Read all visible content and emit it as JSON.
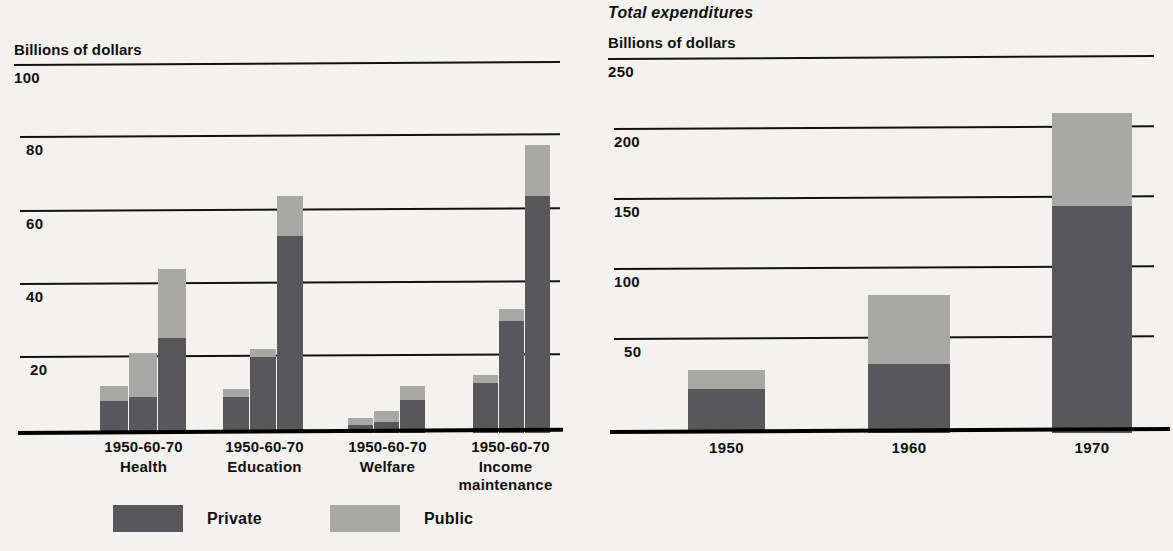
{
  "legend": {
    "items": [
      {
        "label": "Private",
        "color": "#58585a",
        "key": "private"
      },
      {
        "label": "Public",
        "color": "#a8a8a6",
        "key": "public"
      }
    ]
  },
  "left_panel": {
    "axis_title": "Billions of dollars",
    "yticks": [
      "100",
      "80",
      "60",
      "40",
      "20"
    ],
    "group_period_label": "1950-60-70",
    "groups": [
      "Health",
      "Education",
      "Welfare",
      "Income maintenance"
    ]
  },
  "right_panel": {
    "title": "Total expenditures",
    "axis_title": "Billions of dollars",
    "yticks": [
      "250",
      "200",
      "150",
      "100",
      "50"
    ],
    "xticks": [
      "1950",
      "1960",
      "1970"
    ]
  },
  "chart_data": [
    {
      "type": "bar",
      "id": "social-welfare-by-category",
      "title": "",
      "subtitle": "",
      "stacked": true,
      "ylabel": "Billions of dollars",
      "xlabel": "",
      "ylim": [
        0,
        100
      ],
      "yticks": [
        20,
        40,
        60,
        80,
        100
      ],
      "grid": true,
      "legend_position": "bottom",
      "categories": [
        "Health 1950",
        "Health 1960",
        "Health 1970",
        "Education 1950",
        "Education 1960",
        "Education 1970",
        "Welfare 1950",
        "Welfare 1960",
        "Welfare 1970",
        "Income maintenance 1950",
        "Income maintenance 1960",
        "Income maintenance 1970"
      ],
      "groups": [
        {
          "name": "Health",
          "years": [
            "1950",
            "60",
            "70"
          ],
          "private": [
            9,
            10,
            26
          ],
          "public": [
            4,
            12,
            19
          ],
          "total": [
            13,
            22,
            45
          ]
        },
        {
          "name": "Education",
          "years": [
            "1950",
            "60",
            "70"
          ],
          "private": [
            10,
            21,
            54
          ],
          "public": [
            2,
            2,
            11
          ],
          "total": [
            12,
            23,
            65
          ]
        },
        {
          "name": "Welfare",
          "years": [
            "1950",
            "60",
            "70"
          ],
          "private": [
            2,
            3,
            9
          ],
          "public": [
            2,
            3,
            4
          ],
          "total": [
            4,
            6,
            13
          ]
        },
        {
          "name": "Income maintenance",
          "years": [
            "1950",
            "60",
            "70"
          ],
          "private": [
            14,
            31,
            65
          ],
          "public": [
            2,
            3,
            14
          ],
          "total": [
            16,
            34,
            79
          ]
        }
      ],
      "series": [
        {
          "name": "Private",
          "color": "#58585a",
          "values": [
            9,
            10,
            26,
            10,
            21,
            54,
            2,
            3,
            9,
            14,
            31,
            65
          ]
        },
        {
          "name": "Public",
          "color": "#a8a8a6",
          "values": [
            4,
            12,
            19,
            2,
            2,
            11,
            2,
            3,
            4,
            2,
            3,
            14
          ]
        }
      ]
    },
    {
      "type": "bar",
      "id": "total-expenditures",
      "title": "Total expenditures",
      "subtitle": "",
      "stacked": true,
      "ylabel": "Billions of dollars",
      "xlabel": "",
      "ylim": [
        0,
        250
      ],
      "yticks": [
        50,
        100,
        150,
        200,
        250
      ],
      "grid": true,
      "legend_position": "bottom",
      "categories": [
        "1950",
        "1960",
        "1970"
      ],
      "series": [
        {
          "name": "Private",
          "color": "#58585a",
          "values": [
            34,
            48,
            155
          ]
        },
        {
          "name": "Public",
          "color": "#a8a8a6",
          "values": [
            11,
            49,
            67
          ]
        }
      ],
      "totals": [
        45,
        97,
        222
      ]
    }
  ]
}
